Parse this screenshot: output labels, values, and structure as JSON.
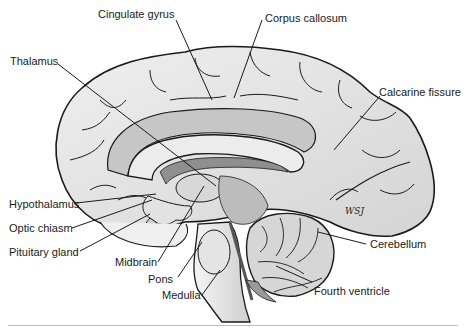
{
  "figure": {
    "signature": "WSJ",
    "labels": {
      "cingulate_gyrus": "Cingulate gyrus",
      "corpus_callosum": "Corpus callosum",
      "thalamus": "Thalamus",
      "calcarine_fissure": "Calcarine fissure",
      "hypothalamus": "Hypothalamus",
      "optic_chiasm": "Optic chiasm",
      "pituitary_gland": "Pituitary gland",
      "midbrain": "Midbrain",
      "pons": "Pons",
      "medulla": "Medulla",
      "cerebellum": "Cerebellum",
      "fourth_ventricle": "Fourth ventricle"
    },
    "colors": {
      "outline": "#1a1a1a",
      "cortex_fill": "#e6e6e6",
      "cortex_shade": "#c8c8c8",
      "dark_fill": "#a9a9a9",
      "background": "#ffffff"
    }
  }
}
